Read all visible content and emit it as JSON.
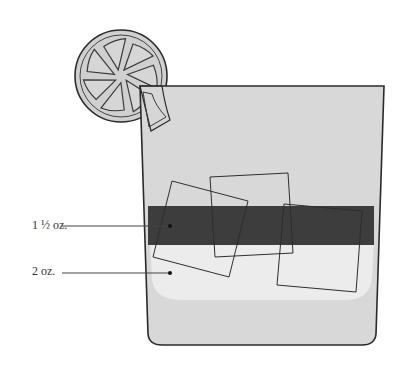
{
  "diagram": {
    "title": "",
    "labels": [
      {
        "id": "layer-top",
        "text": "1 ½ oz.",
        "x": 32,
        "y": 219,
        "leader": {
          "x1": 62,
          "y1": 226,
          "x2": 170,
          "y2": 226
        }
      },
      {
        "id": "layer-bottom",
        "text": "2 oz.",
        "x": 32,
        "y": 264,
        "leader": {
          "x1": 62,
          "y1": 273,
          "x2": 170,
          "y2": 273
        }
      }
    ],
    "colors": {
      "glass_fill": "#d6d6d6",
      "glass_stroke": "#2a2a2a",
      "dark_layer": "#3d3d3d",
      "light_layer": "#ececec",
      "lemon_fill": "#d0d0d0",
      "outline": "#333333"
    },
    "elements": {
      "garnish": "lemon-wheel",
      "glass": "rocks-glass",
      "ice_cubes": 3
    }
  }
}
